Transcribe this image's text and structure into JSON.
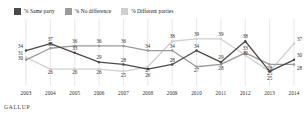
{
  "legend": {
    "items": [
      {
        "label": "% Same party",
        "color": "#4a4a4a",
        "key": "same"
      },
      {
        "label": "% No difference",
        "color": "#9a9a9a",
        "key": "nodiff"
      },
      {
        "label": "% Different parties",
        "color": "#cfcfcf",
        "key": "diff"
      }
    ]
  },
  "source": {
    "text": "GALLUP"
  },
  "chart_data": {
    "type": "line",
    "title": "",
    "xlabel": "",
    "ylabel": "",
    "grid": "vertical",
    "legend_position": "top-left",
    "ylim": [
      20,
      42
    ],
    "categories": [
      "2003",
      "2004",
      "2005",
      "2006",
      "2007",
      "2008",
      "2009",
      "2010",
      "2011",
      "2012",
      "2013",
      "2014"
    ],
    "series": [
      {
        "name": "% Same party",
        "color": "#4a4a4a",
        "values": [
          34,
          37,
          33,
          29,
          28,
          26,
          28,
          34,
          29,
          38,
          25,
          30
        ]
      },
      {
        "name": "% No difference",
        "color": "#9a9a9a",
        "values": [
          30,
          35,
          36,
          36,
          36,
          34,
          34,
          27,
          28,
          33,
          28,
          28
        ]
      },
      {
        "name": "% Different parties",
        "color": "#cfcfcf",
        "values": [
          31,
          26,
          26,
          26,
          25,
          27,
          38,
          39,
          39,
          32,
          25,
          37
        ]
      }
    ]
  }
}
